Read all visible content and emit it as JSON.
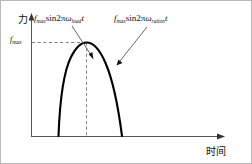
{
  "figure": {
    "background_color": "#ffffff",
    "border_color": "#b9b9b9",
    "curve_color": "#000000",
    "axis_color": "#555555",
    "dashed_color": "#777777"
  },
  "axes": {
    "y_axis_label": "力",
    "x_axis_label": "时间",
    "y_tick_label_html": "f<sub>max</sub>"
  },
  "annotations": [
    {
      "name": "load-force-formula",
      "html": "<span class=\"it\">f</span><sub>max</sub>sin2π<span class=\"it\">ω</span><sub>load</sub><span class=\"it\">t</span>",
      "plain": "fmax sin2πω_load t"
    },
    {
      "name": "rated-force-formula",
      "html": "<span class=\"it\">f</span><sub>max</sub>sin2π<span class=\"it\">ω</span><sub>ration</sub><span class=\"it\">t</span>",
      "plain": "fmax sin2πω_ration t"
    }
  ],
  "chart_data": {
    "type": "line",
    "title": "",
    "xlabel": "时间",
    "ylabel": "力",
    "grid": false,
    "legend_position": "none",
    "xlim": [
      0,
      1
    ],
    "ylim": [
      0,
      1.15
    ],
    "xticks": [],
    "yticks": [
      1.0
    ],
    "ytick_labels": [
      "fmax"
    ],
    "annotations": [
      {
        "text": "fmax sin2πω_load t",
        "arrow_from_px": [
          72,
          26
        ],
        "arrow_to_px": [
          92,
          57
        ]
      },
      {
        "text": "fmax sin2πω_ration t",
        "arrow_from_px": [
          145,
          27
        ],
        "arrow_to_px": [
          116,
          64
        ]
      }
    ],
    "reference_lines": [
      {
        "kind": "horizontal",
        "value": 1.0,
        "label": "fmax",
        "style": "dashed"
      },
      {
        "kind": "vertical",
        "value": 0.435,
        "label": "",
        "style": "dashed"
      }
    ],
    "series": [
      {
        "name": "sinusoidal force pulse",
        "comment": "half-sine-like hump peaking at fmax, steep left leg and broader right leg",
        "x": [
          0.245,
          0.255,
          0.268,
          0.285,
          0.305,
          0.33,
          0.36,
          0.395,
          0.435,
          0.48,
          0.525,
          0.565,
          0.6,
          0.63,
          0.655,
          0.672,
          0.682,
          0.688
        ],
        "y": [
          0.0,
          0.15,
          0.3,
          0.44,
          0.57,
          0.69,
          0.8,
          0.9,
          1.0,
          0.98,
          0.905,
          0.8,
          0.67,
          0.52,
          0.35,
          0.18,
          0.06,
          0.0
        ]
      }
    ]
  }
}
